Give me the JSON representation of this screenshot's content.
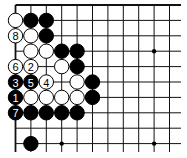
{
  "board": {
    "origin_x": 15.5,
    "origin_y": 5,
    "spacing": 15.4,
    "cols": 11,
    "rows": 10,
    "line_extent_x": 181,
    "line_extent_y": 152,
    "top_edge": true,
    "left_edge": true,
    "star_points": [
      [
        3,
        3
      ],
      [
        9,
        3
      ],
      [
        3,
        9
      ],
      [
        9,
        9
      ]
    ],
    "colors": {
      "black": "#000000",
      "white": "#ffffff",
      "line": "#111111"
    }
  },
  "stones": [
    {
      "col": 0,
      "row": 1,
      "color": "white"
    },
    {
      "col": 1,
      "row": 1,
      "color": "black"
    },
    {
      "col": 2,
      "row": 1,
      "color": "black"
    },
    {
      "col": 0,
      "row": 2,
      "color": "white",
      "label": "8"
    },
    {
      "col": 1,
      "row": 2,
      "color": "white"
    },
    {
      "col": 2,
      "row": 2,
      "color": "black"
    },
    {
      "col": 1,
      "row": 3,
      "color": "white"
    },
    {
      "col": 2,
      "row": 3,
      "color": "white"
    },
    {
      "col": 3,
      "row": 3,
      "color": "black"
    },
    {
      "col": 4,
      "row": 3,
      "color": "black"
    },
    {
      "col": 0,
      "row": 4,
      "color": "white",
      "label": "6"
    },
    {
      "col": 1,
      "row": 4,
      "color": "white",
      "label": "2"
    },
    {
      "col": 3,
      "row": 4,
      "color": "white"
    },
    {
      "col": 4,
      "row": 4,
      "color": "black"
    },
    {
      "col": 0,
      "row": 5,
      "color": "black",
      "label": "3"
    },
    {
      "col": 1,
      "row": 5,
      "color": "black",
      "label": "5"
    },
    {
      "col": 2,
      "row": 5,
      "color": "white",
      "label": "4"
    },
    {
      "col": 4,
      "row": 5,
      "color": "white"
    },
    {
      "col": 5,
      "row": 5,
      "color": "black"
    },
    {
      "col": 0,
      "row": 6,
      "color": "black",
      "label": "1"
    },
    {
      "col": 1,
      "row": 6,
      "color": "white"
    },
    {
      "col": 2,
      "row": 6,
      "color": "white"
    },
    {
      "col": 3,
      "row": 6,
      "color": "white"
    },
    {
      "col": 4,
      "row": 6,
      "color": "white"
    },
    {
      "col": 5,
      "row": 6,
      "color": "black"
    },
    {
      "col": 0,
      "row": 7,
      "color": "black",
      "label": "7"
    },
    {
      "col": 1,
      "row": 7,
      "color": "black"
    },
    {
      "col": 2,
      "row": 7,
      "color": "black"
    },
    {
      "col": 3,
      "row": 7,
      "color": "black"
    },
    {
      "col": 4,
      "row": 7,
      "color": "black"
    },
    {
      "col": 1,
      "row": 9,
      "color": "black"
    }
  ]
}
